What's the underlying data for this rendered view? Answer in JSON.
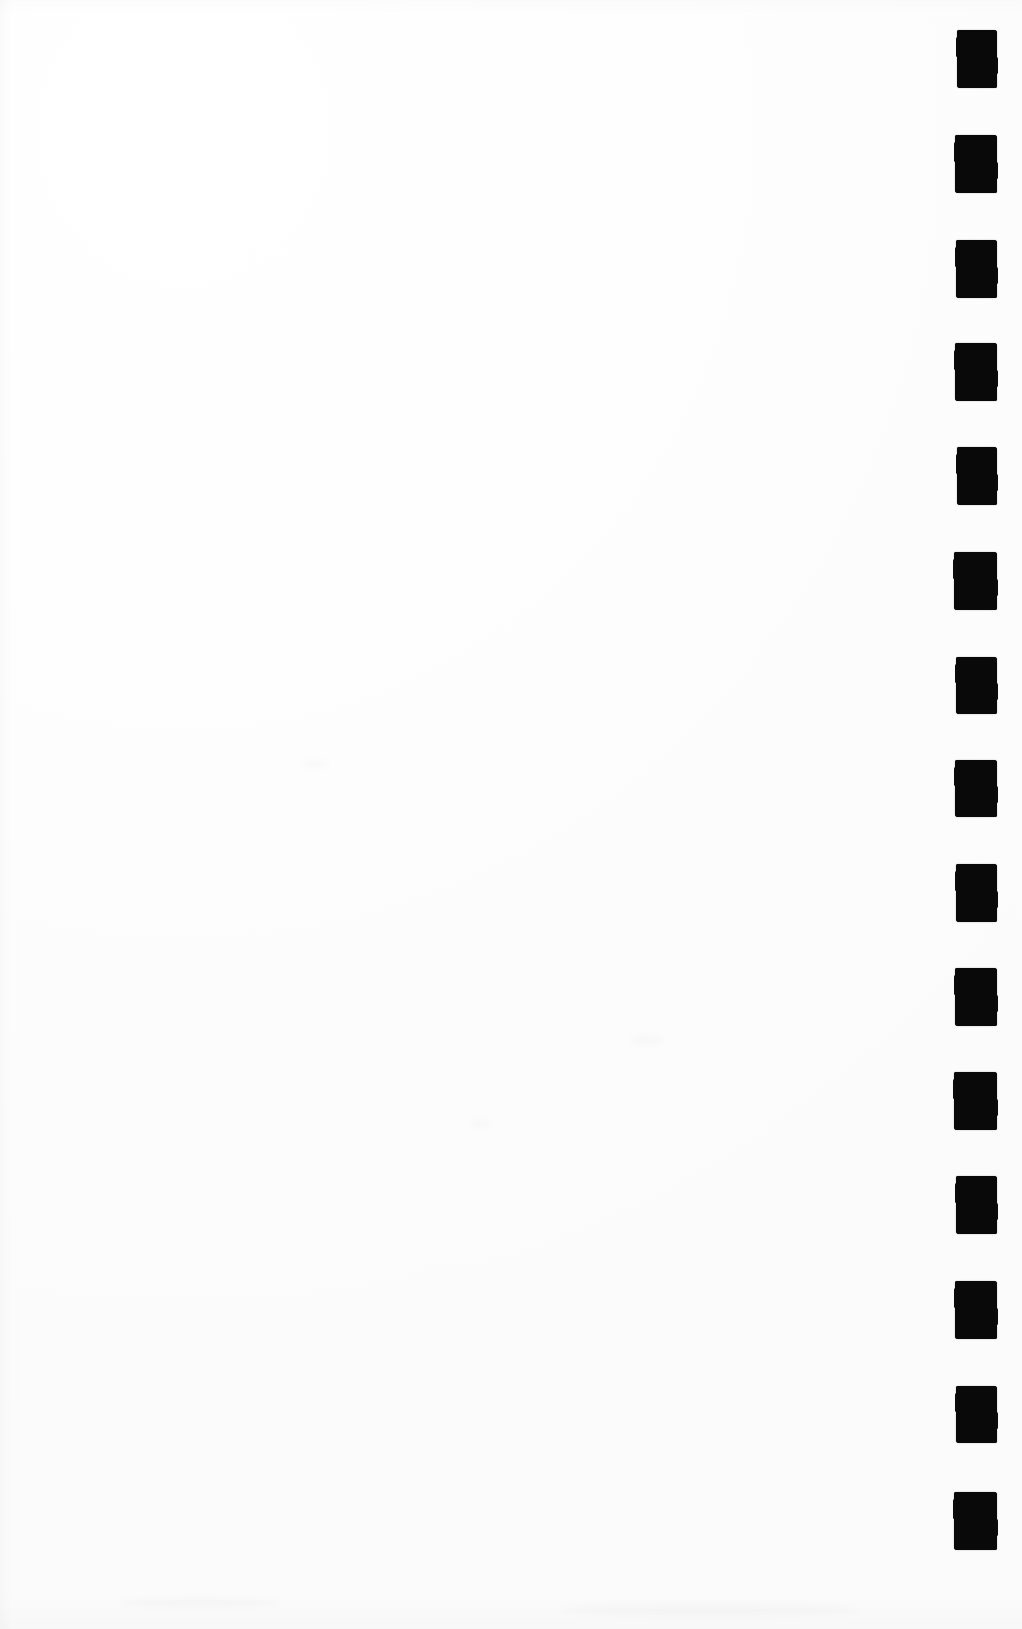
{
  "page": {
    "width": 1022,
    "height": 1629,
    "background_color": "#fefefe",
    "content_text": "",
    "note": "Blank scanned sheet; no printed text, headings, figures or captions are present."
  },
  "marks": {
    "name": "edge-registration-marks",
    "description": "Vertical column of solid black rectangular registration marks along the right edge",
    "count": 15,
    "ink_color": "#090909",
    "left": 955,
    "width": 42,
    "height": 58,
    "pitch": 105,
    "first_top": 30,
    "items": [
      {
        "index": 1,
        "top": 30,
        "left": 957,
        "width": 40,
        "height": 58
      },
      {
        "index": 2,
        "top": 135,
        "left": 955,
        "width": 42,
        "height": 58
      },
      {
        "index": 3,
        "top": 240,
        "left": 956,
        "width": 41,
        "height": 58
      },
      {
        "index": 4,
        "top": 343,
        "left": 955,
        "width": 42,
        "height": 58
      },
      {
        "index": 5,
        "top": 447,
        "left": 957,
        "width": 40,
        "height": 58
      },
      {
        "index": 6,
        "top": 552,
        "left": 954,
        "width": 43,
        "height": 58
      },
      {
        "index": 7,
        "top": 657,
        "left": 956,
        "width": 41,
        "height": 57
      },
      {
        "index": 8,
        "top": 760,
        "left": 955,
        "width": 42,
        "height": 57
      },
      {
        "index": 9,
        "top": 864,
        "left": 956,
        "width": 41,
        "height": 58
      },
      {
        "index": 10,
        "top": 968,
        "left": 955,
        "width": 42,
        "height": 58
      },
      {
        "index": 11,
        "top": 1072,
        "left": 954,
        "width": 43,
        "height": 58
      },
      {
        "index": 12,
        "top": 1176,
        "left": 956,
        "width": 41,
        "height": 58
      },
      {
        "index": 13,
        "top": 1281,
        "left": 955,
        "width": 42,
        "height": 58
      },
      {
        "index": 14,
        "top": 1386,
        "left": 956,
        "width": 41,
        "height": 57
      },
      {
        "index": 15,
        "top": 1492,
        "left": 954,
        "width": 43,
        "height": 58
      }
    ]
  },
  "artifacts": {
    "name": "scan-artifacts",
    "smudges": [
      {
        "left": 300,
        "top": 760,
        "width": 28,
        "height": 8
      },
      {
        "left": 630,
        "top": 1036,
        "width": 34,
        "height": 9
      },
      {
        "left": 470,
        "top": 1120,
        "width": 22,
        "height": 7
      },
      {
        "left": 120,
        "top": 1598,
        "width": 160,
        "height": 10
      },
      {
        "left": 560,
        "top": 1604,
        "width": 300,
        "height": 12
      }
    ]
  }
}
